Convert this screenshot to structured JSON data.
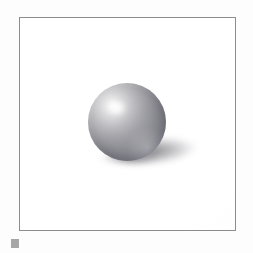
{
  "scene": {
    "title": "Shaded sphere with cast shadow",
    "kind": "3d-render-illustration",
    "frame": {
      "name": "picture-frame",
      "border_color": "#8c8c90",
      "border_width_px": 1,
      "background_color": "#ffffff",
      "x": 19,
      "y": 17,
      "width": 217,
      "height": 214
    },
    "page_background_color": "#fdfdfd",
    "objects": [
      {
        "name": "sphere",
        "shape": "sphere",
        "center_x": 124,
        "center_y": 121,
        "radius": 39,
        "material": "matte-gray",
        "base_color": "#8b8b92",
        "highlight_color": "#ffffff",
        "shadow_side_color": "#6a6a74",
        "light_direction": "upper-left"
      },
      {
        "name": "cast-shadow",
        "shape": "ellipse",
        "center_x": 166,
        "center_y": 149,
        "width": 122,
        "height": 31,
        "rotation_deg": -5,
        "color": "#7a7a80",
        "opacity": 0.62
      },
      {
        "name": "contact-shadow",
        "shape": "ellipse",
        "center_x": 126,
        "center_y": 157,
        "width": 58,
        "height": 16,
        "color": "#46464e",
        "opacity": 0.4
      }
    ],
    "marker": {
      "name": "corner-marker",
      "shape": "square",
      "x": 11,
      "y": 239,
      "size": 8,
      "color": "#a6a6a6"
    }
  }
}
